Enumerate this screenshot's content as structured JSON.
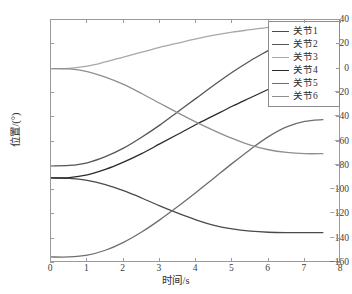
{
  "chart_data": {
    "type": "line",
    "title": "",
    "xlabel": "时间/s",
    "ylabel": "位置/(°)",
    "xlim": [
      0,
      8
    ],
    "ylim": [
      -160,
      40
    ],
    "xticks": [
      0,
      1,
      2,
      3,
      4,
      5,
      6,
      7,
      8
    ],
    "yticks": [
      40,
      20,
      0,
      -20,
      -40,
      -60,
      -80,
      -100,
      -120,
      -140,
      -160
    ],
    "grid": false,
    "legend_position": "upper right",
    "x": [
      0,
      0.5,
      1,
      1.5,
      2,
      2.5,
      3,
      3.5,
      4,
      4.5,
      5,
      5.5,
      6,
      6.5,
      7,
      7.5
    ],
    "series": [
      {
        "name": "关节1",
        "color": "#4a4a4a",
        "values": [
          -90,
          -90.3,
          -92,
          -95.5,
          -100.5,
          -106.5,
          -113,
          -119,
          -124.5,
          -129,
          -132,
          -133.8,
          -134.7,
          -135,
          -135,
          -135
        ]
      },
      {
        "name": "关节2",
        "color": "#555555",
        "values": [
          -80,
          -79.7,
          -77.5,
          -72.5,
          -65.5,
          -56.5,
          -46.5,
          -35.5,
          -24.5,
          -13.5,
          -3,
          6.5,
          15,
          23.5,
          31.5,
          37.5
        ]
      },
      {
        "name": "关节3",
        "color": "#a8a8a8",
        "values": [
          0,
          0.2,
          2,
          5.5,
          9.5,
          13.5,
          17.5,
          21,
          24.5,
          27.5,
          30,
          32,
          34,
          35.5,
          36.8,
          37.5
        ]
      },
      {
        "name": "关节4",
        "color": "#2b2b2b",
        "values": [
          -90,
          -89.7,
          -87.5,
          -83,
          -77,
          -70,
          -62,
          -54,
          -46,
          -38.5,
          -31,
          -24,
          -17,
          -10,
          -3.5,
          23
        ]
      },
      {
        "name": "关节5",
        "color": "#6e6e6e",
        "values": [
          -155,
          -155,
          -153.5,
          -149.5,
          -143,
          -134.5,
          -124.5,
          -113.5,
          -102,
          -90,
          -78,
          -66.5,
          -56,
          -48,
          -43.5,
          -42
        ]
      },
      {
        "name": "关节6",
        "color": "#8f8f8f",
        "values": [
          0,
          -0.3,
          -2.5,
          -7,
          -13,
          -20.5,
          -28.5,
          -36.5,
          -44,
          -51,
          -57.5,
          -63,
          -66.8,
          -69,
          -70,
          -70
        ]
      }
    ]
  },
  "legend": {
    "items": [
      {
        "label": "关节1"
      },
      {
        "label": "关节2"
      },
      {
        "label": "关节3"
      },
      {
        "label": "关节4"
      },
      {
        "label": "关节5"
      },
      {
        "label": "关节6"
      }
    ]
  }
}
